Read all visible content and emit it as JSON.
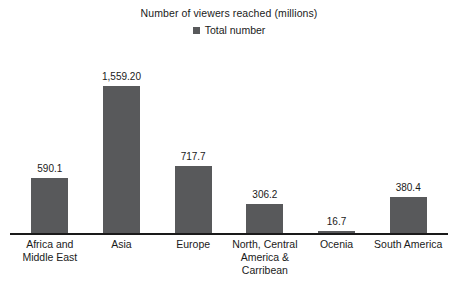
{
  "chart_data": {
    "type": "bar",
    "title": "Number of viewers reached (millions)",
    "subtitle": "",
    "xlabel": "",
    "ylabel": "",
    "grid": false,
    "legend_position": "top-center",
    "ylim": [
      0,
      1700
    ],
    "categories": [
      "Africa and Middle East",
      "Asia",
      "Europe",
      "North, Central America & Carribean",
      "Ocenia",
      "South America"
    ],
    "category_lines": [
      [
        "Africa and",
        "Middle East"
      ],
      [
        "Asia"
      ],
      [
        "Europe"
      ],
      [
        "North, Central",
        "America &",
        "Carribean"
      ],
      [
        "Ocenia"
      ],
      [
        "South America"
      ]
    ],
    "series": [
      {
        "name": "Total number",
        "color": "#58595b",
        "values": [
          590.1,
          1559.2,
          717.7,
          306.2,
          16.7,
          380.4
        ],
        "labels": [
          "590.1",
          "1,559.20",
          "717.7",
          "306.2",
          "16.7",
          "380.4"
        ]
      }
    ]
  },
  "legend": {
    "items": [
      {
        "label": "Total number",
        "color": "#58595b",
        "marker": "square-marker-icon"
      }
    ]
  },
  "colors": {
    "bar": "#58595b",
    "axis": "#1a1a1a",
    "text": "#1a1a1a",
    "background": "#ffffff"
  }
}
